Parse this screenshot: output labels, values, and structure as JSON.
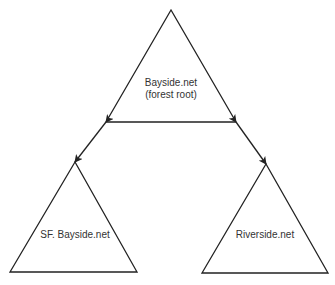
{
  "diagram": {
    "nodes": [
      {
        "id": "root",
        "label_line1": "Bayside.net",
        "label_line2": "(forest root)"
      },
      {
        "id": "sf",
        "label": "SF. Bayside.net"
      },
      {
        "id": "riverside",
        "label": "Riverside.net"
      }
    ],
    "edges": [
      {
        "from": "root",
        "to": "sf",
        "type": "bidirectional-arrow"
      },
      {
        "from": "root",
        "to": "riverside",
        "type": "bidirectional-arrow"
      }
    ],
    "colors": {
      "stroke": "#222222",
      "text": "#333333",
      "background": "#ffffff"
    }
  }
}
